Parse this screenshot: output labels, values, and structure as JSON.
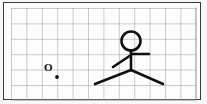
{
  "canvas": {
    "width": 207,
    "height": 104,
    "page_background": "#f7f7f7",
    "paper_background": "#fdfdfd",
    "frame_color": "#3a3a3a",
    "ink_color": "#101010"
  },
  "grid": {
    "label": "graph-paper grid",
    "columns": 12,
    "rows": 6,
    "cell_size_px": 15.4,
    "line_color": "#8c8c8c",
    "line_width_px": 0.9,
    "left_px": 11,
    "top_px": 8,
    "right_px": 196,
    "bottom_px": 100,
    "visible": "true"
  },
  "origin": {
    "letter": "O",
    "marker_name": "origin-dot",
    "marker_x_px": 57,
    "marker_y_px": 77,
    "marker_radius_px": 1.9,
    "label_x_px": 44,
    "label_y_px": 62
  },
  "figure": {
    "name": "stick-figure",
    "stroke_color": "#101010",
    "stroke_width_px": 2.6,
    "head": {
      "center_x_px": 131,
      "center_y_px": 41,
      "radius_px": 9.5
    },
    "torso": {
      "x_px": 131,
      "top_y_px": 50.5,
      "bottom_y_px": 70
    },
    "arm_right": {
      "from_x_px": 131,
      "from_y_px": 54,
      "to_x_px": 149,
      "to_y_px": 54
    },
    "arm_left": {
      "from_x_px": 131,
      "from_y_px": 55,
      "to_x_px": 113,
      "to_y_px": 67
    },
    "leg_left": {
      "from_x_px": 131,
      "from_y_px": 70,
      "to_x_px": 95,
      "to_y_px": 84
    },
    "leg_right": {
      "from_x_px": 131,
      "from_y_px": 70,
      "to_x_px": 163,
      "to_y_px": 84
    }
  }
}
